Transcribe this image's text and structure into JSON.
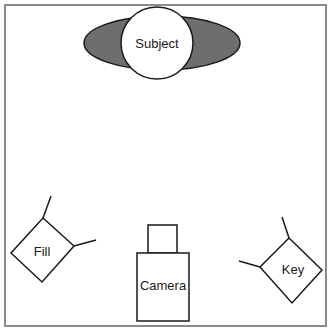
{
  "diagram": {
    "colors": {
      "frame": "#8a8a8a",
      "stroke": "#1a1a1a",
      "subject_shadow": "#6e6e6e",
      "background": "#ffffff"
    },
    "subject": {
      "label": "Subject"
    },
    "fill_light": {
      "label": "Fill"
    },
    "key_light": {
      "label": "Key"
    },
    "camera": {
      "label": "Camera"
    }
  }
}
